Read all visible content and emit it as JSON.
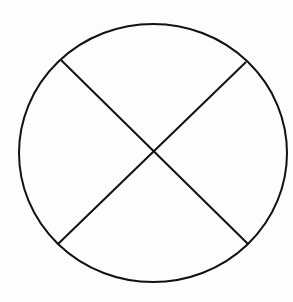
{
  "diagram": {
    "stroke_color": "#111111",
    "background_color": "#fdfdfd",
    "stroke_width": 2,
    "circle": {
      "cx": 153,
      "cy": 153,
      "rx": 134,
      "ry": 129
    },
    "lines": [
      {
        "x1": 61,
        "y1": 60,
        "x2": 248,
        "y2": 244
      },
      {
        "x1": 246,
        "y1": 62,
        "x2": 58,
        "y2": 244
      }
    ],
    "intersection": {
      "x": 155,
      "y": 151
    },
    "sector_count": 4
  }
}
